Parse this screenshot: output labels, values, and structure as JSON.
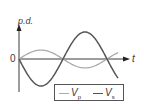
{
  "chart_data": {
    "type": "line",
    "title": "",
    "xlabel": "t",
    "ylabel": "p.d.",
    "origin_label": "0",
    "grid": false,
    "legend_position": "bottom-right",
    "series": [
      {
        "name": "Vp",
        "label_main": "V",
        "label_sub": "p",
        "color": "#aaaaaa",
        "function": "sin",
        "amplitude": 0.33,
        "phase": 0,
        "x": [
          0,
          0.25,
          0.5,
          0.75,
          1.0,
          1.13
        ],
        "values": [
          0,
          0.33,
          0,
          -0.33,
          0,
          0.2
        ]
      },
      {
        "name": "Vs",
        "label_main": "V",
        "label_sub": "s",
        "color": "#555555",
        "function": "-sin",
        "amplitude": 1.0,
        "phase": 0,
        "x": [
          0,
          0.25,
          0.5,
          0.75,
          1.0,
          1.13
        ],
        "values": [
          0,
          -1.0,
          0,
          1.0,
          0,
          -0.6
        ]
      }
    ],
    "x_units": "periods",
    "ylim": [
      -1.2,
      1.2
    ]
  },
  "labels": {
    "y_axis": "p.d.",
    "x_axis": "t",
    "origin": "0"
  },
  "legend": [
    {
      "main": "V",
      "sub": "p",
      "color": "#aaaaaa"
    },
    {
      "main": "V",
      "sub": "s",
      "color": "#555555"
    }
  ],
  "colors": {
    "axis": "#3a3a3a",
    "vp": "#aaaaaa",
    "vs": "#555555"
  }
}
